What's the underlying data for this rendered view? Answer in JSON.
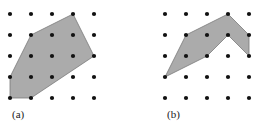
{
  "figure": {
    "background_color": "#ffffff",
    "width": 263,
    "height": 126,
    "lattice_dot_color": "#111111",
    "polygon_fill_color": "#ababab",
    "polygon_stroke_color": "#7a7a7a",
    "caption_color": "#1a1a1a"
  },
  "chart_data": {
    "type": "scatter",
    "xlabel": "",
    "ylabel": "",
    "grid": false,
    "legend": null,
    "panels": [
      {
        "id": "a",
        "caption": "(a)",
        "caption_x": 12,
        "caption_y": 118,
        "lattice": {
          "columns": 5,
          "rows": 5,
          "x_start": 10,
          "y_start": 14,
          "x_step": 21,
          "y_step": 21,
          "dot_radius": 2.1,
          "points": [
            [
              10,
              14
            ],
            [
              31,
              14
            ],
            [
              52,
              14
            ],
            [
              73,
              14
            ],
            [
              94,
              14
            ],
            [
              10,
              35
            ],
            [
              31,
              35
            ],
            [
              52,
              35
            ],
            [
              73,
              35
            ],
            [
              94,
              35
            ],
            [
              10,
              56
            ],
            [
              31,
              56
            ],
            [
              52,
              56
            ],
            [
              73,
              56
            ],
            [
              94,
              56
            ],
            [
              10,
              77
            ],
            [
              31,
              77
            ],
            [
              52,
              77
            ],
            [
              73,
              77
            ],
            [
              94,
              77
            ],
            [
              10,
              98
            ],
            [
              31,
              98
            ],
            [
              52,
              98
            ],
            [
              73,
              98
            ],
            [
              94,
              98
            ]
          ]
        },
        "polygon": {
          "shape": "convex-hexagon",
          "vertices": [
            [
              73,
              14
            ],
            [
              94,
              56
            ],
            [
              31,
              98
            ],
            [
              10,
              98
            ],
            [
              10,
              77
            ],
            [
              31,
              35
            ]
          ],
          "vertex_count": 6
        }
      },
      {
        "id": "b",
        "caption": "(b)",
        "caption_x": 167,
        "caption_y": 118,
        "lattice": {
          "columns": 5,
          "rows": 5,
          "x_start": 165,
          "y_start": 14,
          "x_step": 21,
          "y_step": 21,
          "dot_radius": 2.1,
          "points": [
            [
              165,
              14
            ],
            [
              186,
              14
            ],
            [
              207,
              14
            ],
            [
              228,
              14
            ],
            [
              249,
              14
            ],
            [
              165,
              35
            ],
            [
              186,
              35
            ],
            [
              207,
              35
            ],
            [
              228,
              35
            ],
            [
              249,
              35
            ],
            [
              165,
              56
            ],
            [
              186,
              56
            ],
            [
              207,
              56
            ],
            [
              228,
              56
            ],
            [
              249,
              56
            ],
            [
              165,
              77
            ],
            [
              186,
              77
            ],
            [
              207,
              77
            ],
            [
              228,
              77
            ],
            [
              249,
              77
            ],
            [
              165,
              98
            ],
            [
              186,
              98
            ],
            [
              207,
              98
            ],
            [
              228,
              98
            ],
            [
              249,
              98
            ]
          ]
        },
        "polygon": {
          "shape": "nonconvex-chevron",
          "vertices": [
            [
              228,
              14
            ],
            [
              249,
              35
            ],
            [
              249,
              56
            ],
            [
              228,
              35
            ],
            [
              207,
              56
            ],
            [
              165,
              77
            ],
            [
              186,
              35
            ]
          ],
          "vertex_count": 7
        }
      }
    ]
  }
}
